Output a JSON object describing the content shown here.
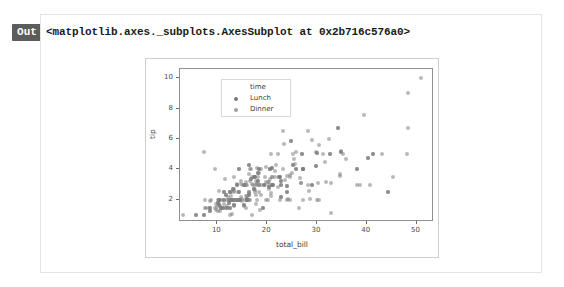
{
  "cell": {
    "out_badge": "Out",
    "repr_text": "<matplotlib.axes._subplots.AxesSubplot at 0x2b716c576a0>"
  },
  "colors": {
    "out_badge_bg": "#5c5c5c",
    "cell_border": "#e4e4e4",
    "figure_border": "#cfcfcf",
    "axes_spine": "#8f8f8f",
    "lunch_marker": "#4c4c4c",
    "dinner_marker": "#7f7f7f",
    "text": "#3c3c3c"
  },
  "chart_data": {
    "type": "scatter",
    "title": "",
    "xlabel": "total_bill",
    "ylabel": "tip",
    "xlim": [
      2.5,
      53.5
    ],
    "ylim": [
      0.55,
      10.6
    ],
    "xticks": [
      10,
      20,
      30,
      40,
      50
    ],
    "yticks": [
      2,
      4,
      6,
      8,
      10
    ],
    "grid": false,
    "legend": {
      "title": "time",
      "position": "upper left",
      "entries": [
        {
          "label": "Lunch",
          "color": "#4c4c4c"
        },
        {
          "label": "Dinner",
          "color": "#7f7f7f"
        }
      ]
    },
    "series": [
      {
        "name": "Lunch",
        "color": "#4c4c4c",
        "points": [
          [
            27.2,
            4.0
          ],
          [
            22.76,
            3.0
          ],
          [
            17.29,
            2.71
          ],
          [
            19.44,
            3.0
          ],
          [
            16.66,
            3.4
          ],
          [
            10.07,
            1.83
          ],
          [
            32.68,
            5.0
          ],
          [
            15.98,
            2.03
          ],
          [
            34.83,
            5.17
          ],
          [
            13.03,
            2.0
          ],
          [
            18.28,
            4.0
          ],
          [
            24.71,
            5.85
          ],
          [
            21.16,
            3.0
          ],
          [
            28.97,
            3.0
          ],
          [
            22.49,
            3.5
          ],
          [
            5.75,
            1.0
          ],
          [
            16.32,
            4.3
          ],
          [
            22.75,
            3.25
          ],
          [
            40.17,
            4.73
          ],
          [
            27.28,
            4.0
          ],
          [
            12.03,
            1.5
          ],
          [
            21.01,
            3.0
          ],
          [
            12.46,
            1.5
          ],
          [
            11.35,
            2.5
          ],
          [
            15.38,
            3.0
          ],
          [
            44.3,
            2.5
          ],
          [
            22.42,
            3.48
          ],
          [
            20.92,
            4.08
          ],
          [
            15.36,
            1.64
          ],
          [
            20.49,
            4.06
          ],
          [
            25.21,
            4.29
          ],
          [
            18.24,
            3.76
          ],
          [
            14.31,
            4.0
          ],
          [
            14.0,
            3.0
          ],
          [
            7.25,
            1.0
          ],
          [
            38.07,
            4.0
          ],
          [
            23.95,
            2.55
          ],
          [
            25.71,
            4.0
          ],
          [
            17.31,
            3.5
          ],
          [
            29.93,
            5.07
          ],
          [
            10.65,
            1.5
          ],
          [
            12.43,
            1.8
          ],
          [
            24.08,
            2.92
          ],
          [
            11.69,
            2.31
          ],
          [
            13.42,
            1.68
          ],
          [
            14.26,
            2.5
          ],
          [
            15.95,
            2.0
          ],
          [
            12.48,
            2.52
          ],
          [
            29.8,
            4.2
          ],
          [
            8.52,
            1.48
          ],
          [
            14.52,
            2.0
          ],
          [
            11.38,
            2.0
          ],
          [
            22.82,
            2.18
          ],
          [
            19.08,
            1.5
          ],
          [
            20.27,
            2.83
          ],
          [
            11.17,
            1.5
          ],
          [
            12.26,
            2.0
          ],
          [
            18.26,
            3.25
          ],
          [
            8.51,
            1.25
          ],
          [
            10.33,
            2.0
          ],
          [
            14.15,
            2.0
          ],
          [
            16.0,
            2.0
          ],
          [
            13.16,
            2.75
          ],
          [
            17.47,
            3.5
          ],
          [
            34.3,
            6.7
          ],
          [
            41.19,
            5.0
          ],
          [
            27.05,
            5.0
          ],
          [
            16.43,
            2.3
          ]
        ]
      },
      {
        "name": "Dinner",
        "color": "#7f7f7f",
        "points": [
          [
            16.99,
            1.01
          ],
          [
            10.34,
            1.66
          ],
          [
            21.01,
            3.5
          ],
          [
            23.68,
            3.31
          ],
          [
            24.59,
            3.61
          ],
          [
            25.29,
            4.71
          ],
          [
            8.77,
            2.0
          ],
          [
            26.88,
            3.12
          ],
          [
            15.04,
            1.96
          ],
          [
            14.78,
            3.23
          ],
          [
            10.27,
            1.71
          ],
          [
            35.26,
            5.0
          ],
          [
            15.42,
            1.57
          ],
          [
            18.43,
            3.0
          ],
          [
            14.83,
            3.02
          ],
          [
            21.58,
            3.92
          ],
          [
            10.33,
            1.67
          ],
          [
            16.29,
            3.71
          ],
          [
            16.97,
            3.5
          ],
          [
            20.65,
            3.35
          ],
          [
            17.92,
            4.08
          ],
          [
            20.29,
            2.75
          ],
          [
            15.77,
            2.23
          ],
          [
            39.42,
            7.58
          ],
          [
            19.82,
            3.18
          ],
          [
            17.81,
            2.34
          ],
          [
            13.37,
            2.0
          ],
          [
            12.69,
            2.0
          ],
          [
            21.7,
            4.3
          ],
          [
            19.65,
            3.0
          ],
          [
            9.55,
            1.45
          ],
          [
            18.35,
            2.5
          ],
          [
            15.06,
            3.0
          ],
          [
            20.69,
            2.45
          ],
          [
            17.78,
            3.27
          ],
          [
            24.06,
            3.6
          ],
          [
            16.31,
            2.0
          ],
          [
            16.93,
            3.07
          ],
          [
            18.69,
            2.31
          ],
          [
            31.27,
            5.0
          ],
          [
            16.04,
            2.24
          ],
          [
            17.46,
            2.54
          ],
          [
            13.94,
            3.06
          ],
          [
            9.68,
            1.32
          ],
          [
            30.4,
            5.6
          ],
          [
            18.29,
            3.0
          ],
          [
            22.23,
            5.0
          ],
          [
            32.4,
            6.0
          ],
          [
            28.55,
            2.05
          ],
          [
            18.04,
            3.0
          ],
          [
            12.54,
            2.5
          ],
          [
            10.29,
            2.6
          ],
          [
            34.81,
            5.2
          ],
          [
            9.94,
            1.56
          ],
          [
            25.56,
            4.34
          ],
          [
            19.49,
            3.51
          ],
          [
            38.01,
            3.0
          ],
          [
            26.41,
            1.5
          ],
          [
            11.24,
            1.76
          ],
          [
            48.27,
            6.73
          ],
          [
            20.29,
            3.21
          ],
          [
            13.81,
            2.0
          ],
          [
            11.02,
            1.98
          ],
          [
            18.29,
            3.76
          ],
          [
            17.59,
            2.64
          ],
          [
            20.08,
            3.15
          ],
          [
            16.45,
            2.47
          ],
          [
            3.07,
            1.0
          ],
          [
            20.23,
            2.01
          ],
          [
            15.01,
            2.09
          ],
          [
            12.02,
            1.97
          ],
          [
            17.07,
            3.0
          ],
          [
            26.86,
            3.14
          ],
          [
            25.28,
            5.0
          ],
          [
            14.73,
            2.2
          ],
          [
            10.51,
            1.25
          ],
          [
            17.92,
            3.08
          ],
          [
            27.2,
            4.0
          ],
          [
            22.76,
            3.0
          ],
          [
            17.29,
            2.71
          ],
          [
            19.44,
            3.0
          ],
          [
            16.66,
            3.4
          ],
          [
            10.07,
            1.83
          ],
          [
            32.68,
            5.0
          ],
          [
            15.98,
            2.03
          ],
          [
            34.83,
            5.17
          ],
          [
            13.03,
            2.0
          ],
          [
            18.28,
            4.0
          ],
          [
            24.71,
            5.85
          ],
          [
            21.16,
            3.0
          ],
          [
            28.97,
            3.0
          ],
          [
            22.49,
            3.5
          ],
          [
            5.75,
            1.0
          ],
          [
            16.32,
            4.3
          ],
          [
            22.75,
            3.25
          ],
          [
            40.17,
            4.73
          ],
          [
            27.28,
            4.0
          ],
          [
            12.03,
            1.5
          ],
          [
            21.01,
            3.0
          ],
          [
            12.46,
            1.5
          ],
          [
            11.35,
            2.5
          ],
          [
            15.38,
            3.0
          ],
          [
            44.3,
            2.5
          ],
          [
            22.42,
            3.48
          ],
          [
            20.92,
            4.08
          ],
          [
            15.36,
            1.64
          ],
          [
            20.49,
            4.06
          ],
          [
            25.21,
            4.29
          ],
          [
            18.24,
            3.76
          ],
          [
            14.31,
            4.0
          ],
          [
            14.0,
            3.0
          ],
          [
            7.25,
            1.0
          ],
          [
            38.07,
            4.0
          ],
          [
            23.95,
            2.55
          ],
          [
            25.71,
            4.0
          ],
          [
            17.31,
            3.5
          ],
          [
            29.93,
            5.07
          ],
          [
            10.65,
            1.5
          ],
          [
            12.43,
            1.8
          ],
          [
            24.08,
            2.92
          ],
          [
            11.69,
            2.31
          ],
          [
            13.42,
            1.68
          ],
          [
            14.26,
            2.5
          ],
          [
            15.95,
            2.0
          ],
          [
            12.48,
            2.52
          ],
          [
            29.8,
            4.2
          ],
          [
            8.52,
            1.48
          ],
          [
            14.52,
            2.0
          ],
          [
            11.38,
            2.0
          ],
          [
            22.82,
            2.18
          ],
          [
            19.08,
            1.5
          ],
          [
            20.27,
            2.83
          ],
          [
            11.17,
            1.5
          ],
          [
            12.26,
            2.0
          ],
          [
            18.26,
            3.25
          ],
          [
            8.51,
            1.25
          ],
          [
            10.33,
            2.0
          ],
          [
            14.15,
            2.0
          ],
          [
            16.0,
            2.0
          ],
          [
            13.16,
            2.75
          ],
          [
            17.47,
            3.5
          ],
          [
            34.3,
            6.7
          ],
          [
            41.19,
            5.0
          ],
          [
            27.05,
            5.0
          ],
          [
            16.43,
            2.3
          ],
          [
            8.35,
            1.5
          ],
          [
            18.64,
            1.36
          ],
          [
            11.87,
            1.63
          ],
          [
            9.78,
            1.73
          ],
          [
            7.51,
            2.0
          ],
          [
            14.07,
            2.5
          ],
          [
            13.13,
            2.0
          ],
          [
            17.26,
            2.74
          ],
          [
            24.55,
            2.0
          ],
          [
            19.77,
            2.0
          ],
          [
            29.85,
            5.14
          ],
          [
            48.17,
            5.0
          ],
          [
            25.0,
            3.75
          ],
          [
            13.39,
            2.61
          ],
          [
            16.49,
            2.0
          ],
          [
            21.5,
            3.5
          ],
          [
            12.66,
            2.5
          ],
          [
            16.21,
            2.0
          ],
          [
            13.81,
            2.0
          ],
          [
            17.51,
            3.0
          ],
          [
            24.52,
            3.48
          ],
          [
            20.76,
            2.24
          ],
          [
            31.71,
            4.5
          ],
          [
            10.59,
            1.61
          ],
          [
            10.63,
            2.0
          ],
          [
            50.81,
            10.0
          ],
          [
            15.81,
            3.16
          ],
          [
            7.25,
            5.15
          ],
          [
            31.85,
            3.18
          ],
          [
            16.82,
            4.0
          ],
          [
            32.9,
            3.11
          ],
          [
            17.89,
            2.0
          ],
          [
            14.48,
            2.0
          ],
          [
            9.6,
            4.0
          ],
          [
            34.63,
            3.55
          ],
          [
            34.65,
            3.68
          ],
          [
            23.33,
            5.65
          ],
          [
            45.35,
            3.5
          ],
          [
            23.17,
            6.5
          ],
          [
            40.55,
            3.0
          ],
          [
            20.69,
            5.0
          ],
          [
            20.9,
            3.5
          ],
          [
            30.46,
            2.0
          ],
          [
            18.15,
            3.5
          ],
          [
            23.1,
            4.0
          ],
          [
            15.69,
            1.5
          ],
          [
            19.81,
            4.19
          ],
          [
            28.44,
            2.56
          ],
          [
            15.48,
            2.02
          ],
          [
            16.58,
            4.0
          ],
          [
            7.56,
            1.44
          ],
          [
            10.34,
            2.0
          ],
          [
            43.11,
            5.0
          ],
          [
            13.0,
            2.0
          ],
          [
            13.51,
            2.0
          ],
          [
            18.71,
            4.0
          ],
          [
            12.74,
            2.01
          ],
          [
            13.0,
            2.0
          ],
          [
            16.4,
            2.5
          ],
          [
            20.53,
            4.0
          ],
          [
            16.47,
            3.23
          ],
          [
            26.59,
            3.41
          ],
          [
            38.73,
            3.0
          ],
          [
            24.27,
            2.03
          ],
          [
            12.76,
            2.23
          ],
          [
            30.06,
            2.0
          ],
          [
            25.89,
            5.16
          ],
          [
            48.33,
            9.0
          ],
          [
            13.27,
            2.5
          ],
          [
            28.17,
            6.5
          ],
          [
            12.9,
            1.1
          ],
          [
            28.15,
            3.0
          ],
          [
            11.59,
            1.5
          ],
          [
            7.74,
            1.44
          ],
          [
            30.14,
            3.09
          ],
          [
            12.16,
            2.2
          ],
          [
            13.42,
            3.48
          ],
          [
            8.58,
            1.92
          ],
          [
            15.98,
            3.0
          ],
          [
            13.42,
            1.58
          ],
          [
            16.27,
            2.5
          ],
          [
            10.09,
            2.0
          ],
          [
            20.45,
            3.0
          ],
          [
            13.28,
            2.72
          ],
          [
            22.12,
            2.88
          ],
          [
            24.01,
            2.0
          ],
          [
            15.69,
            3.0
          ],
          [
            11.61,
            3.39
          ],
          [
            10.77,
            1.47
          ],
          [
            15.53,
            3.0
          ],
          [
            10.07,
            1.25
          ],
          [
            12.6,
            1.0
          ],
          [
            32.83,
            1.17
          ],
          [
            35.83,
            4.67
          ],
          [
            29.03,
            5.92
          ],
          [
            27.18,
            2.0
          ],
          [
            22.67,
            2.0
          ],
          [
            17.82,
            1.75
          ],
          [
            18.78,
            3.0
          ]
        ]
      }
    ]
  }
}
